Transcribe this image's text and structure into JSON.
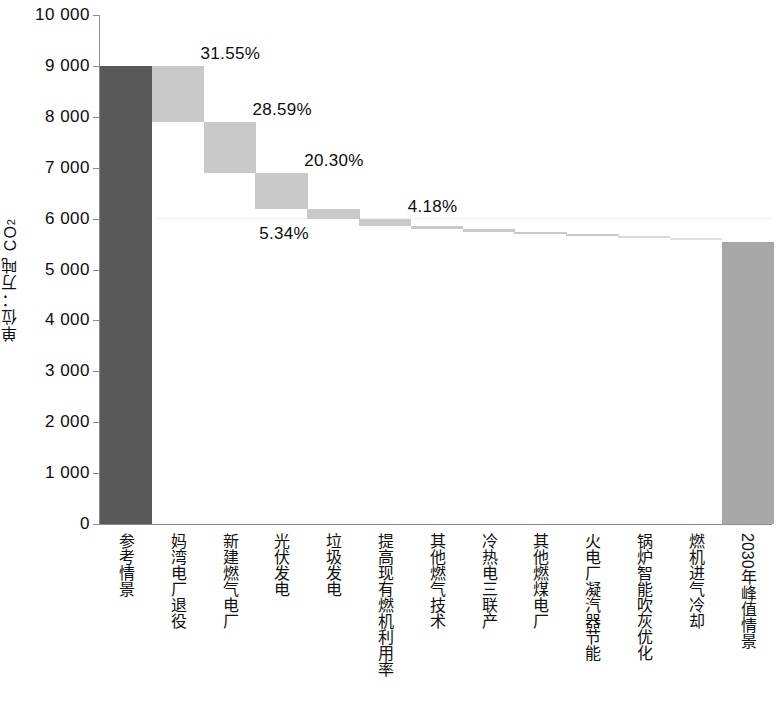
{
  "chart_data": {
    "type": "bar",
    "chart_style": "waterfall",
    "title": "",
    "subtitle": "",
    "xlabel": "",
    "ylabel": "单位：万吨 CO",
    "ylabel_sub": "2",
    "ylim": [
      0,
      10000
    ],
    "yticks": [
      0,
      1000,
      2000,
      3000,
      4000,
      5000,
      6000,
      7000,
      8000,
      9000,
      10000
    ],
    "ytick_labels": [
      "0",
      "1 000",
      "2 000",
      "3 000",
      "4 000",
      "5 000",
      "6 000",
      "7 000",
      "8 000",
      "9 000",
      "10 000"
    ],
    "grid": false,
    "legend": "none",
    "categories": [
      "参考情景",
      "妈湾电厂退役",
      "新建燃气电厂",
      "光伏发电",
      "垃圾发电",
      "提高现有燃机利用率",
      "其他燃气技术",
      "冷热电三联产",
      "其他燃煤电厂",
      "火电厂凝汽器节能",
      "锅炉智能吹灰优化",
      "燃机进气冷却",
      "2030年峰值情景"
    ],
    "bars": [
      {
        "category": "参考情景",
        "kind": "total",
        "base": 0,
        "top": 9000,
        "value": 9000,
        "label": "",
        "color": "#595959"
      },
      {
        "category": "妈湾电厂退役",
        "kind": "decrease",
        "base": 7900,
        "top": 9000,
        "value": 1100,
        "label": "31.55%",
        "color": "#c9c9c9"
      },
      {
        "category": "新建燃气电厂",
        "kind": "decrease",
        "base": 6900,
        "top": 7900,
        "value": 1000,
        "label": "28.59%",
        "color": "#c9c9c9"
      },
      {
        "category": "光伏发电",
        "kind": "decrease",
        "base": 6190,
        "top": 6900,
        "value": 710,
        "label": "20.30%",
        "color": "#c9c9c9"
      },
      {
        "category": "垃圾发电",
        "kind": "decrease",
        "base": 6000,
        "top": 6190,
        "value": 190,
        "label": "5.34%",
        "color": "#c9c9c9"
      },
      {
        "category": "提高现有燃机利用率",
        "kind": "decrease",
        "base": 5855,
        "top": 6000,
        "value": 145,
        "label": "4.18%",
        "color": "#c9c9c9"
      },
      {
        "category": "其他燃气技术",
        "kind": "decrease",
        "base": 5790,
        "top": 5855,
        "value": 65,
        "label": "",
        "color": "#c9c9c9"
      },
      {
        "category": "冷热电三联产",
        "kind": "decrease",
        "base": 5735,
        "top": 5790,
        "value": 55,
        "label": "",
        "color": "#c9c9c9"
      },
      {
        "category": "其他燃煤电厂",
        "kind": "decrease",
        "base": 5690,
        "top": 5735,
        "value": 45,
        "label": "",
        "color": "#c9c9c9"
      },
      {
        "category": "火电厂凝汽器节能",
        "kind": "decrease",
        "base": 5650,
        "top": 5690,
        "value": 40,
        "label": "",
        "color": "#c9c9c9"
      },
      {
        "category": "锅炉智能吹灰优化",
        "kind": "decrease",
        "base": 5620,
        "top": 5650,
        "value": 30,
        "label": "",
        "color": "#d8d8d8"
      },
      {
        "category": "燃机进气冷却",
        "kind": "decrease",
        "base": 5600,
        "top": 5620,
        "value": 20,
        "label": "",
        "color": "#e0e0e0"
      },
      {
        "category": "2030年峰值情景",
        "kind": "total",
        "base": 0,
        "top": 5550,
        "value": 5550,
        "label": "",
        "color": "#a8a8a8"
      }
    ],
    "data_labels": [
      "31.55%",
      "28.59%",
      "20.30%",
      "5.34%",
      "4.18%"
    ],
    "colors": {
      "reference_bar": "#595959",
      "reduction_bar": "#c9c9c9",
      "peak_bar": "#a8a8a8",
      "axis": "#8c8c8c",
      "text": "#0d0d0d"
    }
  }
}
